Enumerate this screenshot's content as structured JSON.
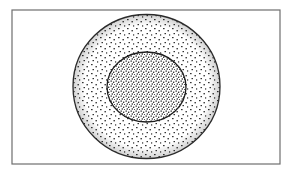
{
  "diagram": {
    "frame": {
      "x": 12,
      "y": 10,
      "width": 268,
      "height": 154,
      "stroke": "#6e6e6e"
    },
    "outer_circle": {
      "cx": 146.5,
      "cy": 86.5,
      "rx": 73.5,
      "ry": 72,
      "stroke": "#2a2a2a",
      "stipple": "sparse"
    },
    "inner_ellipse": {
      "cx": 146.5,
      "cy": 87,
      "rx": 39.5,
      "ry": 35,
      "stroke": "#1e1e1e",
      "stipple": "dense"
    },
    "colors": {
      "background": "#ffffff",
      "ink": "#2b2b2b"
    },
    "labels": []
  }
}
